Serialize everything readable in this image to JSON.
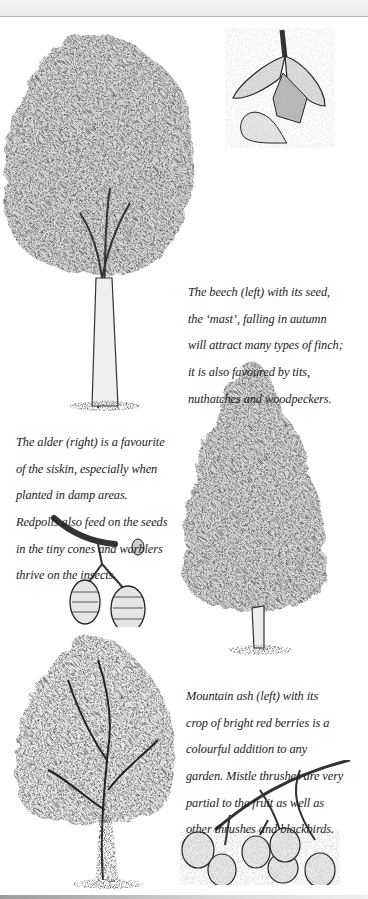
{
  "page": {
    "type": "illustrated book page",
    "background": "#ffffff",
    "ink_color": "#1a1a1a",
    "shade_color": "#cfcfcf"
  },
  "illustrations": [
    {
      "name": "beech-tree",
      "subject": "Beech tree"
    },
    {
      "name": "beech-mast-seed",
      "subject": "Beech seed husk (mast) with nut"
    },
    {
      "name": "alder-tree",
      "subject": "Alder tree"
    },
    {
      "name": "alder-cones",
      "subject": "Alder twig with cones and bud"
    },
    {
      "name": "mountain-ash-tree",
      "subject": "Mountain ash tree"
    },
    {
      "name": "mountain-ash-berries",
      "subject": "Mountain ash berry cluster"
    }
  ],
  "captions": {
    "beech": {
      "lines": [
        "The beech (left) with its seed,",
        "the ‘mast’, falling in autumn",
        "will attract many types of finch;",
        "it is also favoured by tits,",
        "nuthatches and woodpeckers."
      ]
    },
    "alder": {
      "lines": [
        "The alder (right) is a favourite",
        "of the siskin, especially when",
        "planted in damp areas.",
        "Redpolls also feed on the seeds",
        "in the tiny cones and warblers",
        "thrive on the insects."
      ]
    },
    "ash": {
      "lines": [
        "Mountain ash (left) with its",
        "crop of bright red berries is a",
        "colourful addition to any",
        "garden. Mistle thrushes are very",
        "partial to the fruit as well as",
        "other thrushes and blackbirds."
      ]
    }
  }
}
